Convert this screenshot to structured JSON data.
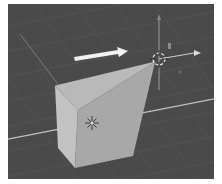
{
  "viewport": {
    "label": "3D Viewport",
    "background": "#4a4a4a",
    "grid_color": "#575757",
    "axis_x_color": "#bdbdbd",
    "axis_y_color": "#9a9a9a"
  },
  "mesh": {
    "label": "Cube (edit mode, vertex dragged)",
    "top_face_color": "#b8b8b8",
    "front_face_color": "#a6a6a6",
    "side_face_color": "#c2c2c2"
  },
  "drag_arrow": {
    "label": "Drag direction",
    "color": "#f2f2f2"
  },
  "cursor_3d": {
    "label": "3D cursor"
  },
  "object_origin": {
    "label": "Object origin"
  },
  "transform_gizmo": {
    "label": "Transform gizmo"
  }
}
